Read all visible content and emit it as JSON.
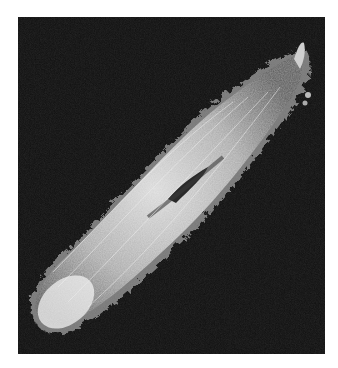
{
  "image": {
    "subject": "scanning electron micrograph of a ciliated protozoan (paramecium)",
    "colors": {
      "background": "#0d0d0d",
      "page": "#ffffff",
      "cell_body": "#bdbdbd",
      "cilia": "#e6e6e6",
      "oral_groove": "#2a2a2a"
    }
  }
}
